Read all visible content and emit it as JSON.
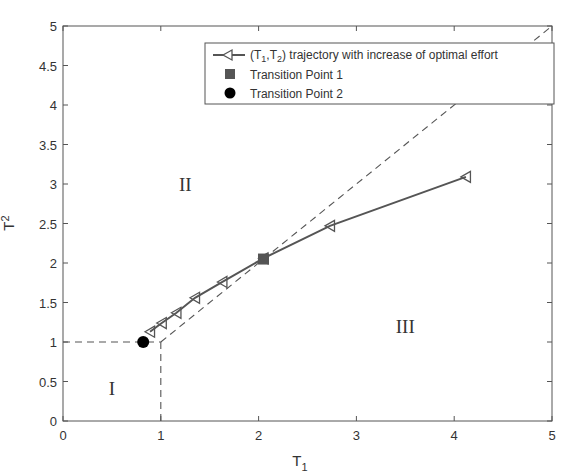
{
  "chart_data": {
    "type": "line",
    "title": "",
    "xlabel": "T",
    "xlabel_sub": "1",
    "ylabel": "T",
    "ylabel_sub": "2",
    "xlim": [
      0,
      5
    ],
    "ylim": [
      0,
      5
    ],
    "grid": false,
    "xticks": [
      0,
      1,
      2,
      3,
      4,
      5
    ],
    "xtick_labels": [
      "0",
      "1",
      "2",
      "3",
      "4",
      "5"
    ],
    "yticks": [
      0,
      0.5,
      1,
      1.5,
      2,
      2.5,
      3,
      3.5,
      4,
      4.5,
      5
    ],
    "ytick_labels": [
      "0",
      "0.5",
      "1",
      "1.5",
      "2",
      "2.5",
      "3",
      "3.5",
      "4",
      "4.5",
      "5"
    ],
    "legend_position": "upper right",
    "series": [
      {
        "name": "(T1,T2) trajectory with increase of optimal effort",
        "style": "solid line with left-pointing triangle markers",
        "color": "#555555",
        "x": [
          0.89,
          1.01,
          1.16,
          1.35,
          1.63,
          2.05,
          2.73,
          4.12
        ],
        "y": [
          1.13,
          1.24,
          1.37,
          1.56,
          1.76,
          2.06,
          2.47,
          3.09
        ]
      },
      {
        "name": "Transition Point 1",
        "style": "filled square marker",
        "color": "#555555",
        "x": [
          2.05
        ],
        "y": [
          2.05
        ]
      },
      {
        "name": "Transition Point 2",
        "style": "filled circle marker",
        "color": "#000000",
        "x": [
          0.82
        ],
        "y": [
          1.0
        ]
      },
      {
        "name": "boundary (dashed)",
        "style": "dashed",
        "color": "#555555",
        "segments": [
          {
            "x": [
              0,
              1
            ],
            "y": [
              1,
              1
            ]
          },
          {
            "x": [
              1,
              1
            ],
            "y": [
              0,
              1
            ]
          },
          {
            "x": [
              1,
              5
            ],
            "y": [
              1,
              5
            ]
          }
        ]
      }
    ],
    "annotations": [
      {
        "text": "I",
        "x": 0.5,
        "y": 0.42
      },
      {
        "text": "II",
        "x": 1.25,
        "y": 3.0
      },
      {
        "text": "III",
        "x": 3.5,
        "y": 1.2
      }
    ],
    "legend": {
      "entries": [
        {
          "label_prefix": "(T",
          "sub1": "1",
          "mid": ",T",
          "sub2": "2",
          "label_suffix": ") trajectory with increase of optimal effort"
        },
        {
          "label": "Transition Point 1"
        },
        {
          "label": "Transition Point 2"
        }
      ]
    }
  }
}
